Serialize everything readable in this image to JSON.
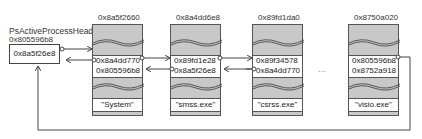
{
  "diagram": {
    "type": "doubly-linked-list",
    "head": {
      "label": "PsActiveProcessHead",
      "address": "0x805596b8",
      "value": "0x8a5f26e8"
    },
    "processes": [
      {
        "address": "0x8a5f2660",
        "flink": "0x8a4dd770",
        "blink": "0x805596b8",
        "name": "\"System\""
      },
      {
        "address": "0x8a4dd6e8",
        "flink": "0x89fd1e28",
        "blink": "0x8a5f26e8",
        "name": "\"smss.exe\""
      },
      {
        "address": "0x89fd1da0",
        "flink": "0x89f34578",
        "blink": "0x8a4dd770",
        "name": "\"csrss.exe\""
      },
      {
        "address": "0x8750a020",
        "flink": "0x805596b8",
        "blink": "0x8752a918",
        "name": "\"visio.exe\""
      }
    ],
    "ellipsis": "···",
    "colors": {
      "box_fill": "#c8c8c8",
      "border": "#555555",
      "line": "#444444"
    }
  }
}
